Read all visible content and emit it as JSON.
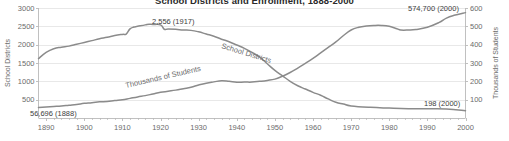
{
  "chart_data": {
    "type": "line",
    "title": "School Districts and Enrollment, 1888-2000",
    "xlabel": "",
    "ylabel": "School Districts",
    "y2label": "Thousands of Students",
    "xlim": [
      1888,
      2000
    ],
    "ylim": [
      0,
      3000
    ],
    "y2lim": [
      0,
      600
    ],
    "grid": true,
    "legend_position": "inline-on-line",
    "xticks": [
      1890,
      1900,
      1910,
      1920,
      1930,
      1940,
      1950,
      1960,
      1970,
      1980,
      1990,
      2000
    ],
    "yticks": [
      500,
      1000,
      1500,
      2000,
      2500,
      3000
    ],
    "y2ticks": [
      100,
      200,
      300,
      400,
      500,
      600
    ],
    "annotations": [
      {
        "text": "2,556 (1917)",
        "x": 1917,
        "y_axis": "left",
        "value": 2556
      },
      {
        "text": "56,696 (1888)",
        "x": 1888,
        "y_axis": "right",
        "value": 56.696
      },
      {
        "text": "574,700 (2000)",
        "x": 2000,
        "y_axis": "right",
        "value": 574.7
      },
      {
        "text": "198 (2000)",
        "x": 2000,
        "y_axis": "left",
        "value": 198
      }
    ],
    "series": [
      {
        "name": "School Districts",
        "axis": "left",
        "inline_label": "School Districts",
        "x": [
          1888,
          1890,
          1892,
          1894,
          1896,
          1898,
          1900,
          1902,
          1904,
          1906,
          1908,
          1910,
          1911,
          1912,
          1913,
          1914,
          1916,
          1917,
          1918,
          1920,
          1921,
          1922,
          1924,
          1926,
          1928,
          1930,
          1932,
          1934,
          1936,
          1938,
          1940,
          1942,
          1944,
          1946,
          1948,
          1950,
          1952,
          1954,
          1956,
          1958,
          1960,
          1962,
          1964,
          1966,
          1968,
          1970,
          1975,
          1980,
          1985,
          1990,
          1995,
          2000
        ],
        "values": [
          1620,
          1790,
          1890,
          1930,
          1960,
          2010,
          2060,
          2110,
          2160,
          2200,
          2250,
          2280,
          2290,
          2430,
          2480,
          2500,
          2540,
          2556,
          2550,
          2540,
          2420,
          2430,
          2420,
          2400,
          2390,
          2350,
          2290,
          2230,
          2150,
          2080,
          1990,
          1900,
          1790,
          1660,
          1480,
          1300,
          1150,
          1000,
          880,
          790,
          700,
          620,
          520,
          430,
          380,
          330,
          290,
          270,
          255,
          250,
          245,
          198
        ]
      },
      {
        "name": "Thousands of Students",
        "axis": "right",
        "inline_label": "Thousands of Students",
        "x": [
          1888,
          1890,
          1892,
          1894,
          1896,
          1898,
          1900,
          1902,
          1904,
          1906,
          1908,
          1910,
          1912,
          1914,
          1916,
          1918,
          1920,
          1922,
          1924,
          1926,
          1928,
          1930,
          1932,
          1934,
          1936,
          1938,
          1940,
          1942,
          1944,
          1946,
          1948,
          1950,
          1952,
          1954,
          1956,
          1958,
          1960,
          1962,
          1964,
          1966,
          1968,
          1970,
          1972,
          1974,
          1976,
          1978,
          1980,
          1982,
          1983,
          1985,
          1987,
          1990,
          1993,
          1995,
          1997,
          2000
        ],
        "values": [
          56.7,
          60,
          63,
          66,
          70,
          74,
          80,
          83,
          88,
          90,
          95,
          99,
          107,
          115,
          122,
          131,
          140,
          146,
          152,
          160,
          168,
          180,
          190,
          197,
          203,
          200,
          195,
          196,
          196,
          200,
          205,
          212,
          228,
          248,
          272,
          298,
          325,
          355,
          385,
          415,
          450,
          480,
          495,
          502,
          505,
          505,
          500,
          487,
          480,
          480,
          483,
          495,
          520,
          545,
          560,
          574.7
        ]
      }
    ]
  },
  "axis_titles": {
    "left": "School Districts",
    "right": "Thousands of Students"
  },
  "colors": {
    "line": "#8b8b8b",
    "grid": "#e2e2e2",
    "axis": "#b9b9b9",
    "text": "#6b6b6b",
    "title": "#2a2a2a"
  }
}
